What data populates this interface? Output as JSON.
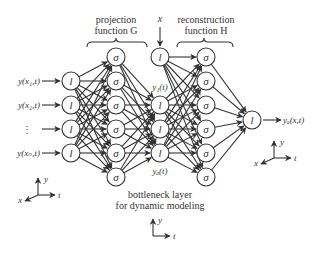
{
  "diagram": {
    "projection_label_line1": "projection",
    "projection_label_line2": "function G",
    "reconstruction_label_line1": "reconstruction",
    "reconstruction_label_line2": "function H",
    "x_input_label": "x",
    "bottleneck_label_line1": "bottleneck layer",
    "bottleneck_label_line2": "for dynamic modeling",
    "inputs": [
      "y(x₁,t)",
      "y(x₂,t)",
      "⋮",
      "y(xₙ,t)"
    ],
    "output_label": "yₐ(x,t)",
    "y1_label": "y₁(t)",
    "yd_label": "yₐ(t)",
    "linear_node_symbol": "l",
    "sigmoid_node_symbol": "σ",
    "axes_left": {
      "x": "x",
      "y": "y",
      "t": "t"
    },
    "axes_right": {
      "x": "x",
      "y": "y",
      "t": "t"
    },
    "axes_bottom": {
      "y": "y",
      "t": "t"
    },
    "layers": {
      "input_linear": 4,
      "projection_sigmoid": 6,
      "bottleneck_linear": 4,
      "reconstruction_sigmoid": 6,
      "output_linear": 1
    }
  }
}
